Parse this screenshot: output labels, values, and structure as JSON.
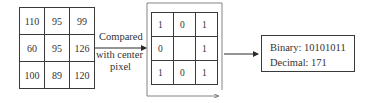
{
  "diagram": {
    "input_grid": [
      [
        "110",
        "95",
        "99"
      ],
      [
        "60",
        "95",
        "126"
      ],
      [
        "100",
        "89",
        "120"
      ]
    ],
    "comparison_label": {
      "line1": "Compared",
      "line2": "with center",
      "line3": "pixel"
    },
    "binary_grid": [
      [
        "1",
        "0",
        "1"
      ],
      [
        "0",
        "",
        "1"
      ],
      [
        "1",
        "0",
        "1"
      ]
    ],
    "result": {
      "binary": "Binary: 10101011",
      "decimal": "Decimal: 171"
    },
    "colors": {
      "stroke": "#3a3a3a",
      "text": "#333333",
      "background": "#ffffff"
    }
  }
}
